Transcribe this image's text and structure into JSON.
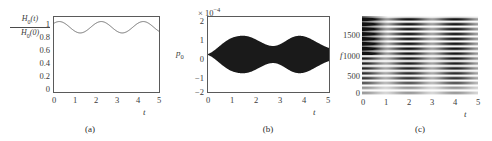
{
  "figure": {
    "background": "#ffffff",
    "axis_color": "#5a5a5a",
    "text_color": "#3a3a3a"
  },
  "panels": [
    {
      "id": "a",
      "caption": "(a)",
      "ylabel_numerator": "H",
      "ylabel_numerator_sub": "0",
      "ylabel_numerator_arg": "(t)",
      "ylabel_denominator": "H",
      "ylabel_denominator_sub": "0",
      "ylabel_denominator_arg": "(0)",
      "xlabel": "t",
      "yticks": [
        "1",
        "0.8",
        "0.6",
        "0.4",
        "0.2",
        "0"
      ],
      "xticks": [
        "0",
        "1",
        "2",
        "3",
        "4",
        "5"
      ]
    },
    {
      "id": "b",
      "caption": "(b)",
      "ylabel": "p",
      "ylabel_sub": "0",
      "xlabel": "t",
      "exponent_prefix": "× 10",
      "exponent_power": "−4",
      "yticks": [
        "2",
        "1",
        "0",
        "−1",
        "−2"
      ],
      "xticks": [
        "0",
        "1",
        "2",
        "3",
        "4",
        "5"
      ]
    },
    {
      "id": "c",
      "caption": "(c)",
      "ylabel": "f",
      "xlabel": "t",
      "yticks": [
        "1500",
        "1000",
        "500",
        "0"
      ],
      "xticks": [
        "0",
        "1",
        "2",
        "3",
        "4",
        "5"
      ]
    }
  ],
  "chart_data": [
    {
      "type": "line",
      "panel": "a",
      "title": "",
      "xlabel": "t",
      "ylabel": "H0(t)/H0(0)",
      "xlim": [
        0,
        5
      ],
      "ylim": [
        0,
        1.12
      ],
      "grid": false,
      "legend": "none",
      "xtick_values": [
        0,
        1,
        2,
        3,
        4,
        5
      ],
      "ytick_values": [
        0,
        0.2,
        0.4,
        0.6,
        0.8,
        1
      ],
      "description": "Normalized magnetic field amplitude oscillating about 0.97 with period ~2 time units, ranging from about 0.88 to 1.05.",
      "series": [
        {
          "name": "H0(t)/H0(0)",
          "mean": 0.967,
          "amplitude": 0.085,
          "period": 2.0,
          "phase": 0.25,
          "x": [
            0,
            0.1,
            0.2,
            0.3,
            0.4,
            0.5,
            0.6,
            0.7,
            0.8,
            0.9,
            1,
            1.1,
            1.2,
            1.3,
            1.4,
            1.5,
            1.6,
            1.7,
            1.8,
            1.9,
            2,
            2.1,
            2.2,
            2.3,
            2.4,
            2.5,
            2.6,
            2.7,
            2.8,
            2.9,
            3,
            3.1,
            3.2,
            3.3,
            3.4,
            3.5,
            3.6,
            3.7,
            3.8,
            3.9,
            4,
            4.1,
            4.2,
            4.3,
            4.4,
            4.5,
            4.6,
            4.7,
            4.8,
            4.9,
            5
          ],
          "values": [
            1.0,
            1.026,
            1.044,
            1.052,
            1.052,
            1.047,
            1.035,
            1.018,
            0.999,
            0.978,
            0.957,
            0.94,
            0.925,
            0.913,
            0.905,
            0.901,
            0.902,
            0.908,
            0.919,
            0.935,
            0.953,
            0.972,
            0.991,
            1.01,
            1.027,
            1.04,
            1.049,
            1.052,
            1.05,
            1.043,
            1.031,
            1.015,
            0.995,
            0.974,
            0.953,
            0.934,
            0.918,
            0.907,
            0.901,
            0.9,
            0.904,
            0.913,
            0.927,
            0.944,
            0.963,
            0.983,
            1.003,
            1.021,
            1.036,
            1.047,
            1.052
          ]
        }
      ]
    },
    {
      "type": "line",
      "panel": "b",
      "title": "",
      "xlabel": "t",
      "ylabel": "p0",
      "y_scale_factor": "1e-4",
      "xlim": [
        0,
        5
      ],
      "ylim": [
        -2,
        2
      ],
      "grid": false,
      "legend": "none",
      "xtick_values": [
        0,
        1,
        2,
        3,
        4,
        5
      ],
      "ytick_values": [
        -2,
        -1,
        0,
        1,
        2
      ],
      "description": "High-frequency pressure oscillation filling a beating envelope. Envelope is near zero at t=0, swells to about 1.0 near t=1.5, narrows to about 0.45 near t=2.6, swells again to about 1.0 near t=3.6, and narrows to about 0.35 at t=5.",
      "carrier_frequency": 120,
      "envelope": {
        "x": [
          0,
          0.15,
          0.3,
          0.45,
          0.6,
          0.75,
          0.9,
          1.05,
          1.2,
          1.35,
          1.5,
          1.65,
          1.8,
          1.95,
          2.1,
          2.25,
          2.4,
          2.55,
          2.7,
          2.85,
          3.0,
          3.15,
          3.3,
          3.45,
          3.6,
          3.75,
          3.9,
          4.05,
          4.2,
          4.35,
          4.5,
          4.65,
          4.8,
          4.95,
          5.0
        ],
        "values": [
          0.02,
          0.12,
          0.26,
          0.42,
          0.58,
          0.72,
          0.84,
          0.92,
          0.97,
          1.0,
          1.0,
          0.97,
          0.91,
          0.82,
          0.72,
          0.62,
          0.53,
          0.47,
          0.45,
          0.48,
          0.56,
          0.67,
          0.79,
          0.9,
          0.97,
          1.0,
          0.99,
          0.94,
          0.86,
          0.76,
          0.65,
          0.55,
          0.45,
          0.37,
          0.35
        ]
      }
    },
    {
      "type": "heatmap",
      "panel": "c",
      "title": "",
      "xlabel": "t",
      "ylabel": "f",
      "xlim": [
        0,
        5
      ],
      "ylim": [
        0,
        1850
      ],
      "grid": false,
      "legend": "none",
      "colormap": "grayscale",
      "xtick_values": [
        0,
        1,
        2,
        3,
        4,
        5
      ],
      "ytick_values": [
        0,
        500,
        1000,
        1500
      ],
      "description": "Time-frequency spectrogram showing evenly spaced horizontal spectral bands spaced about 115 Hz apart, with intensity modulated in time: darker near t=0-0.6, t=2.0-2.6 and t=4.0-4.6. A bright (low-intensity) band lies near f=250 and strong dark content above f=1000 at early times.",
      "band_spacing": 115,
      "band_first": 60,
      "time_modulation_period": 2.0
    }
  ]
}
